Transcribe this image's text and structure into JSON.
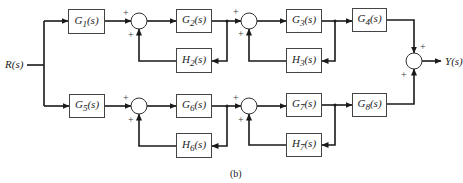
{
  "diagram": {
    "caption": "(b)",
    "input": {
      "name": "R",
      "arg": "(s)"
    },
    "output": {
      "name": "Y",
      "arg": "(s)"
    },
    "blocks": {
      "G1": {
        "name": "G",
        "sub": "1",
        "arg": "(s)"
      },
      "G2": {
        "name": "G",
        "sub": "2",
        "arg": "(s)"
      },
      "G3": {
        "name": "G",
        "sub": "3",
        "arg": "(s)"
      },
      "G4": {
        "name": "G",
        "sub": "4",
        "arg": "(s)"
      },
      "G5": {
        "name": "G",
        "sub": "5",
        "arg": "(s)"
      },
      "G6": {
        "name": "G",
        "sub": "6",
        "arg": "(s)"
      },
      "G7": {
        "name": "G",
        "sub": "7",
        "arg": "(s)"
      },
      "G8": {
        "name": "G",
        "sub": "8",
        "arg": "(s)"
      },
      "H2": {
        "name": "H",
        "sub": "2",
        "arg": "(s)"
      },
      "H3": {
        "name": "H",
        "sub": "3",
        "arg": "(s)"
      },
      "H6": {
        "name": "H",
        "sub": "6",
        "arg": "(s)"
      },
      "H7": {
        "name": "H",
        "sub": "7",
        "arg": "(s)"
      }
    },
    "signs": {
      "plus": "+"
    },
    "summing_junctions": [
      {
        "id": "S1",
        "inputs": [
          "G1 (+)",
          "H2 (+)"
        ]
      },
      {
        "id": "S2",
        "inputs": [
          "G2 (+)",
          "H3 (+)"
        ]
      },
      {
        "id": "S5",
        "inputs": [
          "G5 (+)",
          "H6 (+)"
        ]
      },
      {
        "id": "S6",
        "inputs": [
          "G6 (+)",
          "H7 (+)"
        ]
      },
      {
        "id": "Sout",
        "inputs": [
          "G4 (+)",
          "G8 (+)"
        ]
      }
    ]
  }
}
